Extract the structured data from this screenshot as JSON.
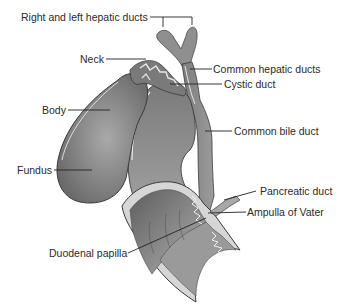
{
  "diagram": {
    "labels": {
      "right_left_hepatic": "Right and left hepatic ducts",
      "neck": "Neck",
      "common_hepatic": "Common hepatic ducts",
      "cystic_duct": "Cystic duct",
      "body": "Body",
      "common_bile": "Common bile duct",
      "fundus": "Fundus",
      "pancreatic_duct": "Pancreatic duct",
      "ampulla": "Ampulla of Vater",
      "duodenal_papilla": "Duodenal papilla"
    },
    "colors": {
      "organ_dark": "#6e6e6e",
      "organ_mid": "#8a8a8a",
      "organ_light": "#b5b5b5",
      "wall": "#d9d9d9",
      "outline": "#3a3a3a",
      "leader": "#222222"
    }
  }
}
